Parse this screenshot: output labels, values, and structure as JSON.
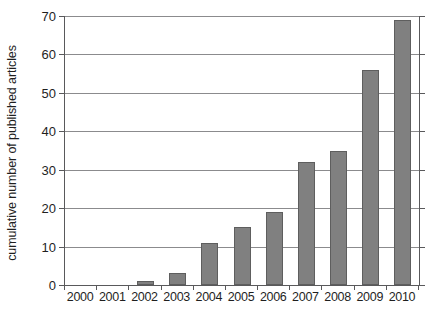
{
  "chart_data": {
    "type": "bar",
    "title": "",
    "xlabel": "",
    "ylabel": "cumulative number of published articles",
    "categories": [
      "2000",
      "2001",
      "2002",
      "2003",
      "2004",
      "2005",
      "2006",
      "2007",
      "2008",
      "2009",
      "2010"
    ],
    "values": [
      0,
      0,
      1,
      3,
      11,
      15,
      19,
      32,
      35,
      56,
      69
    ],
    "ylim": [
      0,
      70
    ],
    "ytick_labels": [
      "70",
      "60",
      "50",
      "40",
      "30",
      "20",
      "10",
      "0"
    ],
    "ytick_values": [
      70,
      60,
      50,
      40,
      30,
      20,
      10,
      0
    ],
    "ystep": 10,
    "grid": true,
    "legend": "none",
    "bar_color": "#808080",
    "bar_edge_color": "#5e5e5e",
    "axis_color": "#59595b",
    "grid_color": "#8b8b8d",
    "background_color": "#ffffff"
  }
}
